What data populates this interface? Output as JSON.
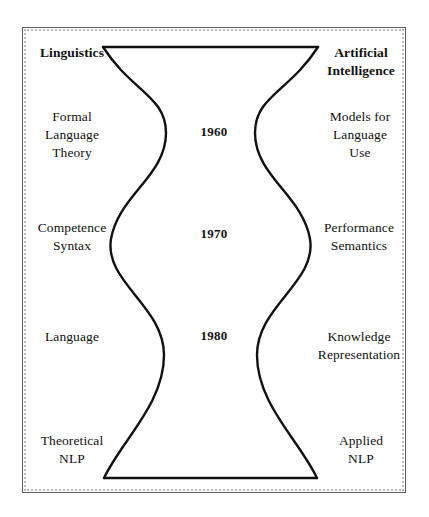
{
  "diagram": {
    "title_left": "Linguistics",
    "title_right": "Artificial\nIntelligence",
    "left_labels": [
      "Linguistics",
      "Formal\nLanguage\nTheory",
      "Competence\nSyntax",
      "Language",
      "Theoretical\nNLP"
    ],
    "right_labels": [
      "Artificial\nIntelligence",
      "Models for\nLanguage\nUse",
      "Performance\nSemantics",
      "Knowledge\nRepresentation",
      "Applied\nNLP"
    ],
    "left": {
      "heading": "Linguistics",
      "row1": "Formal\nLanguage\nTheory",
      "row2": "Competence\nSyntax",
      "row3": "Language",
      "row4": "Theoretical\nNLP"
    },
    "right": {
      "heading": "Artificial\nIntelligence",
      "row1": "Models for\nLanguage\nUse",
      "row2": "Performance\nSemantics",
      "row3": "Knowledge\nRepresentation",
      "row4": "Applied\nNLP"
    },
    "decades": {
      "first": "1960",
      "second": "1970",
      "third": "1980"
    },
    "colors": {
      "background": "#ffffff",
      "stroke": "#111111",
      "frame": "#5d5d5d",
      "frame_dotted": "#b9b9b9",
      "text": "#111111"
    }
  }
}
